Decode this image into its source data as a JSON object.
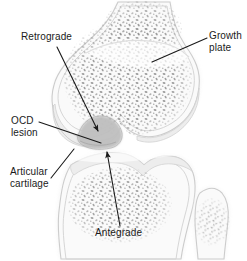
{
  "figure": {
    "width": 247,
    "height": 261,
    "background_color": "#ffffff",
    "ink_color": "#1a1a1a",
    "bone_fill_color": "#f2f2f2",
    "bone_outline_color": "#c9c9c9",
    "cartilage_color": "#ebebeb",
    "trabecular_speckle_color": "#8c8c8c",
    "lesion_color": "#bdbdbd"
  },
  "labels": {
    "retrograde": {
      "lines": [
        "Retrograde"
      ],
      "line1": "Retrograde"
    },
    "growth_plate": {
      "lines": [
        "Growth",
        "plate"
      ],
      "line1": "Growth",
      "line2": "plate"
    },
    "ocd_lesion": {
      "lines": [
        "OCD",
        "lesion"
      ],
      "line1": "OCD",
      "line2": "lesion"
    },
    "articular_cartilage": {
      "lines": [
        "Articular",
        "cartilage"
      ],
      "line1": "Articular",
      "line2": "cartilage"
    },
    "antegrade": {
      "lines": [
        "Antegrade"
      ],
      "line1": "Antegrade"
    }
  },
  "anatomy": {
    "femur": "distal femur with condyles",
    "tibia": "proximal tibia",
    "fibula": "proximal fibula",
    "growth_plate": "physis",
    "lesion": "osteochondritis dissecans lesion",
    "articular_cartilage": "articular cartilage"
  },
  "leaders": {
    "retrograde": {
      "type": "arrow",
      "from": [
        57,
        47
      ],
      "to": [
        100,
        134
      ]
    },
    "growth_plate": {
      "type": "line",
      "from": [
        207,
        38
      ],
      "to": [
        152,
        62
      ]
    },
    "ocd_lesion": {
      "type": "line",
      "from": [
        39,
        122
      ],
      "to": [
        101,
        143
      ]
    },
    "articular_cartilage": {
      "type": "line",
      "from": [
        51,
        178
      ],
      "to": [
        74,
        149
      ]
    },
    "antegrade": {
      "type": "arrow",
      "from": [
        120,
        226
      ],
      "to": [
        106,
        150
      ]
    }
  }
}
